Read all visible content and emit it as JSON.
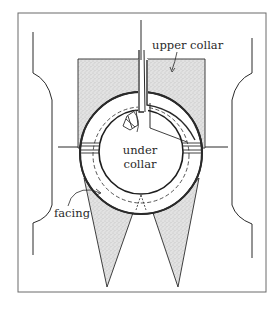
{
  "figure": {
    "type": "sewing-construction-diagram",
    "labels": {
      "upper_collar": "upper collar",
      "under_collar_line1": "under",
      "under_collar_line2": "collar",
      "facing": "facing"
    },
    "colors": {
      "line": "#2a2a2a",
      "stipple_fill": "#d9d9d9",
      "frame": "#555555",
      "background": "#ffffff"
    }
  }
}
